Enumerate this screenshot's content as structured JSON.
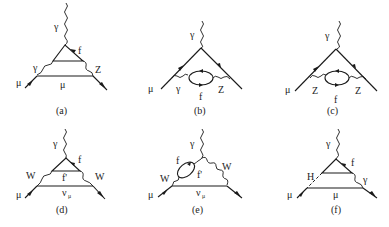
{
  "figure": {
    "diagrams": [
      {
        "id": "a",
        "caption": "(a)",
        "labels": {
          "top": "γ",
          "loop": "f",
          "left_boson": "γ",
          "right_boson": "Z",
          "lower": "μ",
          "in": "μ"
        }
      },
      {
        "id": "b",
        "caption": "(b)",
        "labels": {
          "top": "γ",
          "in": "μ",
          "left_boson": "γ",
          "loop": "f",
          "right_boson": "Z"
        }
      },
      {
        "id": "c",
        "caption": "(c)",
        "labels": {
          "top": "γ",
          "in": "μ",
          "left_boson": "Z",
          "loop": "f",
          "right_boson": "Z"
        }
      },
      {
        "id": "d",
        "caption": "(d)",
        "labels": {
          "top": "γ",
          "loop": "f",
          "inner": "f'",
          "left_boson": "W",
          "right_boson": "W",
          "lower": "ν",
          "lower_sub": "μ",
          "in": "μ"
        }
      },
      {
        "id": "e",
        "caption": "(e)",
        "labels": {
          "top": "γ",
          "loop": "f",
          "inner": "f'",
          "left_boson": "W",
          "right_boson": "W",
          "lower": "ν",
          "lower_sub": "μ",
          "in": "μ"
        }
      },
      {
        "id": "f",
        "caption": "(f)",
        "labels": {
          "top": "γ",
          "loop": "f",
          "left_scalar": "H",
          "right_boson": "γ",
          "lower": "μ",
          "in": "μ"
        }
      }
    ]
  }
}
